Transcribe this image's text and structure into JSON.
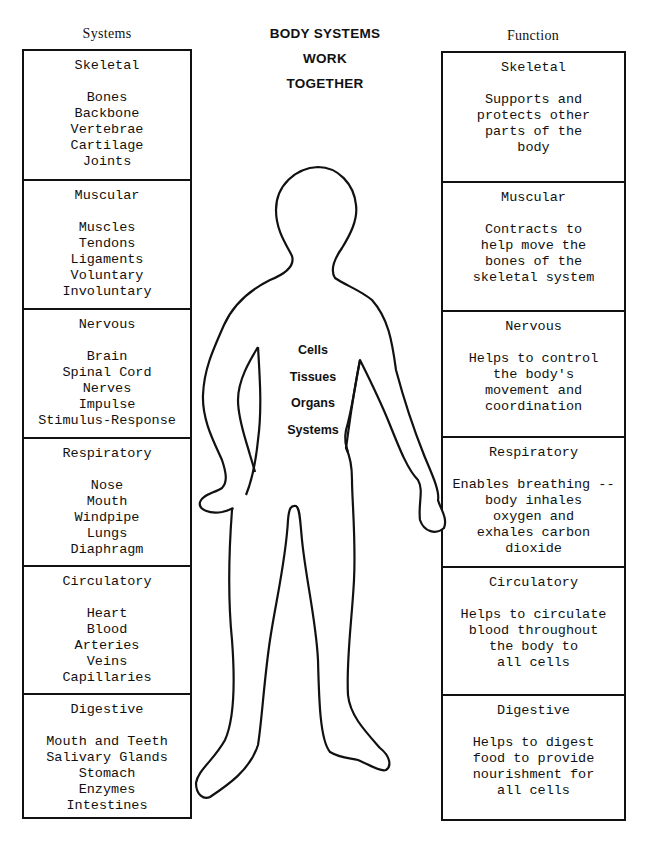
{
  "title": {
    "lines": [
      "BODY SYSTEMS",
      "WORK",
      "TOGETHER"
    ]
  },
  "left_column": {
    "header": "Systems",
    "rows": [
      {
        "name": "Skeletal",
        "items": [
          "Bones",
          "Backbone",
          "Vertebrae",
          "Cartilage",
          "Joints"
        ]
      },
      {
        "name": "Muscular",
        "items": [
          "Muscles",
          "Tendons",
          "Ligaments",
          "Voluntary",
          "Involuntary"
        ]
      },
      {
        "name": "Nervous",
        "items": [
          "Brain",
          "Spinal Cord",
          "Nerves",
          "Impulse",
          "Stimulus-Response"
        ]
      },
      {
        "name": "Respiratory",
        "items": [
          "Nose",
          "Mouth",
          "Windpipe",
          "Lungs",
          "Diaphragm"
        ]
      },
      {
        "name": "Circulatory",
        "items": [
          "Heart",
          "Blood",
          "Arteries",
          "Veins",
          "Capillaries"
        ]
      },
      {
        "name": "Digestive",
        "items": [
          "Mouth and Teeth",
          "Salivary Glands",
          "Stomach",
          "Enzymes",
          "Intestines"
        ]
      }
    ]
  },
  "right_column": {
    "header": "Function",
    "rows": [
      {
        "name": "Skeletal",
        "items": [
          "Supports and",
          "protects other",
          "parts of the",
          "body"
        ]
      },
      {
        "name": "Muscular",
        "items": [
          "Contracts to",
          "help move the",
          "bones of the",
          "skeletal system"
        ]
      },
      {
        "name": "Nervous",
        "items": [
          "Helps to control",
          "the body's",
          "movement and",
          "coordination"
        ]
      },
      {
        "name": "Respiratory",
        "items": [
          "Enables breathing --",
          "body inhales",
          "oxygen and",
          "exhales carbon",
          "dioxide"
        ]
      },
      {
        "name": "Circulatory",
        "items": [
          "Helps to circulate",
          "blood throughout",
          "the body to",
          "all cells"
        ]
      },
      {
        "name": "Digestive",
        "items": [
          "Helps to digest",
          "food to provide",
          "nourishment for",
          "all cells"
        ]
      }
    ]
  },
  "figure": {
    "levels": [
      "Cells",
      "Tissues",
      "Organs",
      "Systems"
    ]
  }
}
